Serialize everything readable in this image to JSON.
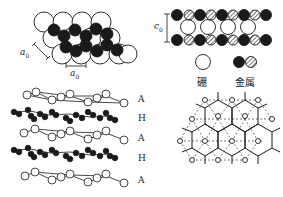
{
  "diagram": {
    "title": "",
    "panels": {
      "top_view": {
        "labels": {
          "a0_side": "a",
          "a0_side_sub": "0",
          "a0_bottom": "a",
          "a0_bottom_sub": "0"
        }
      },
      "side_view": {
        "labels": {
          "c0": "c",
          "c0_sub": "0"
        }
      },
      "legend": {
        "items": [
          {
            "symbol": "open-circle",
            "label": "硼"
          },
          {
            "symbol": "filled-and-hatched-circles",
            "label": "金属"
          }
        ]
      },
      "layer_stack": {
        "layer_labels": [
          "A",
          "H",
          "A",
          "H",
          "A"
        ]
      },
      "honeycomb_lattice": {
        "labels": []
      }
    },
    "colors": {
      "line": "#1a1a1a",
      "metal_fill": "#1a1a1a",
      "boron_fill": "#ffffff",
      "background": "#ffffff"
    }
  }
}
